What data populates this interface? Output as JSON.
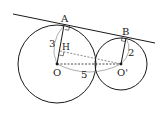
{
  "diagram": {
    "type": "geometry",
    "colors": {
      "stroke": "#1a1a1a",
      "thin": "#555555",
      "background": "#ffffff"
    },
    "labels": {
      "A": "A",
      "B": "B",
      "H": "H",
      "O": "O",
      "O_prime": "O'",
      "radius_big": "3",
      "radius_small": "2",
      "center_distance": "5"
    },
    "circles": [
      {
        "name": "circle-O",
        "center": "O",
        "radius_value": 3
      },
      {
        "name": "circle-O-prime",
        "center": "O'",
        "radius_value": 2
      }
    ],
    "segments": [
      {
        "from": "A",
        "to": "B",
        "style": "solid",
        "role": "common tangent"
      },
      {
        "from": "O",
        "to": "A",
        "style": "solid",
        "length": 3
      },
      {
        "from": "O'",
        "to": "B",
        "style": "solid",
        "length": 2
      },
      {
        "from": "O",
        "to": "O'",
        "style": "dashed",
        "length": 5
      },
      {
        "from": "H",
        "to": "O'",
        "style": "dashed"
      }
    ],
    "right_angles": [
      "A",
      "B",
      "H"
    ]
  }
}
